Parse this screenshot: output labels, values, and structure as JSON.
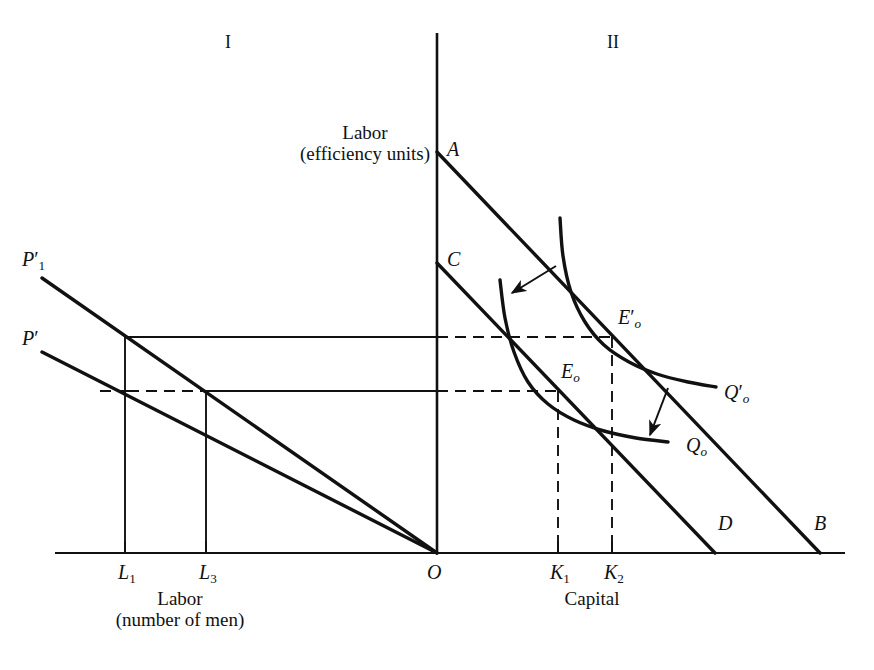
{
  "figure": {
    "quadrant_labels": [
      {
        "text": "I",
        "x": 228,
        "y": 32
      },
      {
        "text": "II",
        "x": 613,
        "y": 32
      }
    ],
    "axis_labels": {
      "vertical": {
        "line1": "Labor",
        "line2": "(efficiency units)",
        "x": 365,
        "y": 122
      },
      "left_horizontal": {
        "line1": "Labor",
        "line2": "(number of men)",
        "x": 180,
        "y": 588
      },
      "right_horizontal": {
        "line1": "Capital",
        "x": 592,
        "y": 588
      }
    },
    "point_labels": [
      {
        "name": "A",
        "text": "A",
        "sub": "",
        "prime": "",
        "x": 447,
        "y": 138
      },
      {
        "name": "C",
        "text": "C",
        "sub": "",
        "prime": "",
        "x": 447,
        "y": 248
      },
      {
        "name": "P-prime-1",
        "text": "P",
        "sub": "1",
        "prime": "'",
        "x": 22,
        "y": 248
      },
      {
        "name": "P-prime",
        "text": "P",
        "sub": "",
        "prime": "'",
        "x": 22,
        "y": 327
      },
      {
        "name": "E-prime-0",
        "text": "E",
        "sub": "o",
        "prime": "'",
        "x": 618,
        "y": 306
      },
      {
        "name": "E-0",
        "text": "E",
        "sub": "o",
        "prime": "",
        "x": 561,
        "y": 360
      },
      {
        "name": "Q-prime-0",
        "text": "Q",
        "sub": "o",
        "prime": "'",
        "x": 724,
        "y": 381
      },
      {
        "name": "Q-0",
        "text": "Q",
        "sub": "o",
        "prime": "",
        "x": 686,
        "y": 434
      },
      {
        "name": "D",
        "text": "D",
        "sub": "",
        "prime": "",
        "x": 718,
        "y": 512
      },
      {
        "name": "B",
        "text": "B",
        "sub": "",
        "prime": "",
        "x": 814,
        "y": 512
      },
      {
        "name": "O",
        "text": "O",
        "sub": "",
        "prime": "",
        "x": 427,
        "y": 561
      }
    ],
    "tick_labels": [
      {
        "name": "L1",
        "text": "L",
        "sub": "1",
        "x": 118,
        "y": 561
      },
      {
        "name": "L3",
        "text": "L",
        "sub": "3",
        "x": 199,
        "y": 561
      },
      {
        "name": "K1",
        "text": "K",
        "sub": "1",
        "x": 550,
        "y": 561
      },
      {
        "name": "K2",
        "text": "K",
        "sub": "2",
        "x": 604,
        "y": 561
      }
    ],
    "colors": {
      "ink": "#111111",
      "background": "#ffffff"
    }
  },
  "chart_data": {
    "type": "line",
    "title": "",
    "xlabel": "Labor (number of men) | Capital",
    "ylabel": "Labor (efficiency units)",
    "origin": {
      "x": 437,
      "y": 553
    },
    "axes": {
      "horizontal": {
        "x1": 55,
        "y1": 553,
        "x2": 845,
        "y2": 553
      },
      "vertical": {
        "x1": 437,
        "y1": 33,
        "x2": 437,
        "y2": 553
      }
    },
    "lines": [
      {
        "name": "isocost-AB",
        "label": "AB",
        "x1": 437,
        "y1": 152,
        "x2": 820,
        "y2": 553,
        "style": "solid"
      },
      {
        "name": "isocost-CD",
        "label": "CD",
        "x1": 437,
        "y1": 263,
        "x2": 715,
        "y2": 553,
        "style": "solid"
      },
      {
        "name": "efficiency-P-prime-1",
        "label": "P'1",
        "x1": 42,
        "y1": 278,
        "x2": 437,
        "y2": 553,
        "style": "solid"
      },
      {
        "name": "efficiency-P-prime",
        "label": "P'",
        "x1": 42,
        "y1": 352,
        "x2": 437,
        "y2": 553,
        "style": "solid"
      }
    ],
    "curves": [
      {
        "name": "isoquant-Q-0",
        "label": "Q0",
        "style": "solid",
        "points": [
          [
            500,
            280
          ],
          [
            505,
            318
          ],
          [
            514,
            352
          ],
          [
            528,
            382
          ],
          [
            548,
            404
          ],
          [
            574,
            420
          ],
          [
            604,
            431
          ],
          [
            636,
            438
          ],
          [
            668,
            442
          ]
        ]
      },
      {
        "name": "isoquant-Q-prime-0",
        "label": "Q'0",
        "style": "solid",
        "points": [
          [
            560,
            218
          ],
          [
            563,
            256
          ],
          [
            571,
            292
          ],
          [
            585,
            322
          ],
          [
            604,
            345
          ],
          [
            629,
            362
          ],
          [
            657,
            374
          ],
          [
            688,
            382
          ],
          [
            716,
            387
          ]
        ]
      }
    ],
    "guides": [
      {
        "name": "guide-L1-horizontal",
        "x1": 125,
        "y1": 337,
        "x2": 437,
        "y2": 337,
        "style": "solid"
      },
      {
        "name": "guide-L3-horizontal",
        "x1": 206,
        "y1": 391,
        "x2": 437,
        "y2": 391,
        "style": "solid"
      },
      {
        "name": "guide-L1-vertical",
        "x1": 125,
        "y1": 337,
        "x2": 125,
        "y2": 553,
        "style": "solid"
      },
      {
        "name": "guide-L3-vertical",
        "x1": 206,
        "y1": 391,
        "x2": 206,
        "y2": 553,
        "style": "solid"
      },
      {
        "name": "guide-E-prime-0-horizontal",
        "x1": 437,
        "y1": 337,
        "x2": 612,
        "y2": 337,
        "style": "dashed"
      },
      {
        "name": "guide-E-0-horizontal",
        "x1": 437,
        "y1": 391,
        "x2": 558,
        "y2": 391,
        "style": "dashed"
      },
      {
        "name": "guide-K2-vertical",
        "x1": 612,
        "y1": 337,
        "x2": 612,
        "y2": 553,
        "style": "dashed"
      },
      {
        "name": "guide-K1-vertical",
        "x1": 558,
        "y1": 391,
        "x2": 558,
        "y2": 553,
        "style": "dashed"
      },
      {
        "name": "guide-L1-dash-left",
        "x1": 100,
        "y1": 391,
        "x2": 128,
        "y2": 391,
        "style": "dashed"
      },
      {
        "name": "guide-L3-dash-short",
        "x1": 128,
        "y1": 391,
        "x2": 206,
        "y2": 391,
        "style": "dashed"
      }
    ],
    "ticks": [
      {
        "name": "tick-L1",
        "x": 125,
        "y": 553
      },
      {
        "name": "tick-L3",
        "x": 206,
        "y": 553
      },
      {
        "name": "tick-K1",
        "x": 558,
        "y": 553
      },
      {
        "name": "tick-K2",
        "x": 612,
        "y": 553
      }
    ],
    "arrows": [
      {
        "name": "arrow-to-Q0-upper",
        "x1": 556,
        "y1": 266,
        "x2": 512,
        "y2": 293
      },
      {
        "name": "arrow-to-Q0-lower",
        "x1": 668,
        "y1": 388,
        "x2": 650,
        "y2": 435
      }
    ],
    "equilibrium_points": [
      {
        "name": "E_o",
        "x": 558,
        "y": 391,
        "capital": "K_1",
        "labor_men": "L_3"
      },
      {
        "name": "E'_o",
        "x": 612,
        "y": 337,
        "capital": "K_2",
        "labor_men": "L_1"
      }
    ]
  }
}
